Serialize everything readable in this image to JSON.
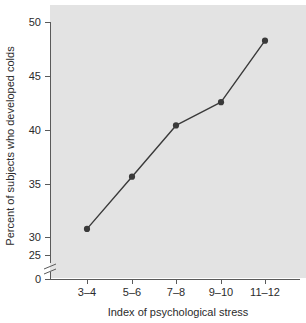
{
  "chart_data": {
    "type": "line",
    "title": "",
    "subtitle": "",
    "xlabel": "Index of psychological stress",
    "ylabel": "Percent of subjects who developed colds",
    "categories": [
      "3–4",
      "5–6",
      "7–8",
      "9–10",
      "11–12"
    ],
    "values": [
      27.8,
      33.4,
      38.9,
      41.4,
      48.0
    ],
    "series": [
      {
        "name": "Percent who developed colds",
        "values": [
          27.8,
          33.4,
          38.9,
          41.4,
          48.0
        ]
      }
    ],
    "y_tick_labels": [
      "0",
      "25",
      "30",
      "35",
      "40",
      "45",
      "50"
    ],
    "y_tick_values": [
      0,
      25,
      30,
      35,
      40,
      45,
      50
    ],
    "ylim": [
      25,
      50
    ],
    "axis_break": true,
    "axis_break_between": [
      0,
      25
    ],
    "grid": false,
    "legend": "none",
    "marker": "filled-circle",
    "plot_background": "#e3e3e3",
    "line_color": "#3a3a3a",
    "axis_color": "#5a5a5a"
  }
}
